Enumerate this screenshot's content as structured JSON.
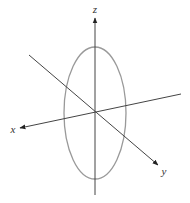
{
  "diagram": {
    "type": "3d-coordinate-axes-with-ellipse",
    "colors": {
      "axis": "#444444",
      "ellipse": "#999999",
      "label": "#333333",
      "background": "#ffffff"
    },
    "origin": {
      "x": 95,
      "y": 113
    },
    "axes": [
      {
        "name": "z",
        "label": "z",
        "from": {
          "x": 95,
          "y": 195
        },
        "to": {
          "x": 95,
          "y": 18
        },
        "label_pos": {
          "x": 95,
          "y": 13
        }
      },
      {
        "name": "x",
        "label": "x",
        "from": {
          "x": 181,
          "y": 94
        },
        "to": {
          "x": 20,
          "y": 128
        },
        "label_pos": {
          "x": 13,
          "y": 133
        }
      },
      {
        "name": "y",
        "label": "y",
        "from": {
          "x": 29,
          "y": 55
        },
        "to": {
          "x": 158,
          "y": 165
        },
        "label_pos": {
          "x": 164,
          "y": 175
        }
      }
    ],
    "ellipse": {
      "cx": 95,
      "cy": 113,
      "rx": 31,
      "ry": 66
    }
  }
}
